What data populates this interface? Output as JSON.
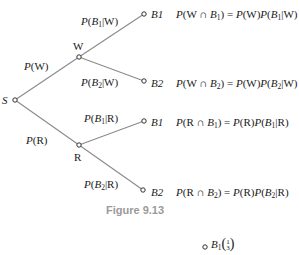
{
  "figure": {
    "caption": "Figure 9.13",
    "nodes": {
      "start": "S",
      "w": "W",
      "r": "R",
      "w_b1": "B1",
      "w_b2": "B2",
      "r_b1": "B1",
      "r_b2": "B2"
    },
    "edge_labels": {
      "s_w": {
        "p": "P",
        "arg": "(W)"
      },
      "s_r": {
        "p": "P",
        "arg": "(R)"
      },
      "w_b1": {
        "p": "P",
        "open": "(",
        "b": "B",
        "sub": "1",
        "cond": "|W)"
      },
      "w_b2": {
        "p": "P",
        "open": "(",
        "b": "B",
        "sub": "2",
        "cond": "|W)"
      },
      "r_b1": {
        "p": "P",
        "open": "(",
        "b": "B",
        "sub": "1",
        "cond": "|R)"
      },
      "r_b2": {
        "p": "P",
        "open": "(",
        "b": "B",
        "sub": "2",
        "cond": "|R)"
      }
    },
    "equations": [
      {
        "lhs_a": "(W ∩ ",
        "sub": "1",
        "mid": ") = ",
        "rhs_a": "(W)",
        "rhs_b": "(",
        "rhs_sub": "1",
        "rhs_c": "|W)"
      },
      {
        "lhs_a": "(W ∩ ",
        "sub": "2",
        "mid": ") = ",
        "rhs_a": "(W)",
        "rhs_b": "(",
        "rhs_sub": "2",
        "rhs_c": "|W)"
      },
      {
        "lhs_a": "(R ∩ ",
        "sub": "1",
        "mid": ") = ",
        "rhs_a": "(R)",
        "rhs_b": "(",
        "rhs_sub": "1",
        "rhs_c": "|R)"
      },
      {
        "lhs_a": "(R ∩ ",
        "sub": "2",
        "mid": ") = ",
        "rhs_a": "(R)",
        "rhs_b": "(",
        "rhs_sub": "2",
        "rhs_c": "|R)"
      }
    ],
    "next_figure_partial": {
      "node": "B",
      "sub": "1",
      "fraction_num": "1",
      "fraction_den": "3"
    },
    "colors": {
      "line": "#8a8a8a",
      "text": "#1a1a1a",
      "caption": "#9a9a9a"
    }
  }
}
